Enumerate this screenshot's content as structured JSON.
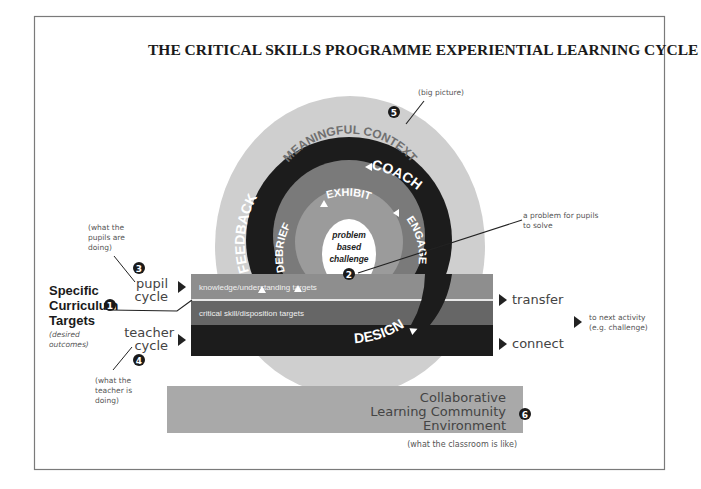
{
  "title": "THE CRITICAL SKILLS PROGRAMME EXPERIENTIAL LEARNING CYCLE",
  "colors": {
    "outer_context": "#cfcfcf",
    "teacher_ring": "#1c1c1c",
    "pupil_ring": "#7a7a7a",
    "inner_disc": "#9b9b9b",
    "center_disc": "#ffffff",
    "knowledge_bar": "#8e8e8e",
    "skill_bar": "#666666",
    "teacher_bar": "#1c1c1c",
    "community_bar": "#a9a9a9",
    "frame": "#777777"
  },
  "outer_ring": {
    "label": "MEANINGFUL CONTEXT",
    "marker": "5",
    "annotation": "(big picture)"
  },
  "teacher_ring": {
    "labels": [
      "COACH",
      "FEEDBACK",
      "DESIGN"
    ]
  },
  "pupil_ring": {
    "labels": [
      "EXHIBIT",
      "DEBRIEF",
      "ENGAGE"
    ]
  },
  "center": {
    "lines": [
      "problem",
      "based",
      "challenge"
    ],
    "marker": "2",
    "annotation_lines": [
      "a problem for pupils",
      "to solve"
    ]
  },
  "bars": {
    "knowledge": "knowledge/understanding targets",
    "skills": "critical skill/disposition targets"
  },
  "left": {
    "targets": {
      "lines": [
        "Specific",
        "Curriculum",
        "Targets"
      ],
      "marker": "1",
      "note_lines": [
        "(desired",
        "outcomes)"
      ]
    },
    "pupil_cycle": {
      "lines": [
        "pupil",
        "cycle"
      ],
      "marker": "3",
      "note_lines": [
        "(what the",
        "pupils are",
        "doing)"
      ]
    },
    "teacher_cycle": {
      "lines": [
        "teacher",
        "cycle"
      ],
      "marker": "4",
      "note_lines": [
        "(what the",
        "teacher is",
        "doing)"
      ]
    }
  },
  "right": {
    "transfer": "transfer",
    "connect": "connect",
    "next_lines": [
      "to next activity",
      "(e.g. challenge)"
    ]
  },
  "community": {
    "lines": [
      "Collaborative",
      "Learning Community",
      "Environment"
    ],
    "marker": "6",
    "note": "(what the classroom is like)"
  }
}
